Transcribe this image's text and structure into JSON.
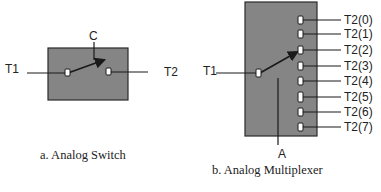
{
  "colors": {
    "box_fill": "#858585",
    "box_stroke": "#2a2a2a",
    "line": "#1a1a1a",
    "contact_fill": "#ffffff",
    "text": "#222222"
  },
  "switch": {
    "caption": "a. Analog Switch",
    "control_label": "C",
    "input_label": "T1",
    "output_label": "T2"
  },
  "multiplexer": {
    "caption": "b. Analog Multiplexer",
    "address_label": "A",
    "input_label": "T1",
    "outputs": [
      "T2(0)",
      "T2(1)",
      "T2(2)",
      "T2(3)",
      "T2(4)",
      "T2(5)",
      "T2(6)",
      "T2(7)"
    ],
    "selected_output_index": 2
  }
}
